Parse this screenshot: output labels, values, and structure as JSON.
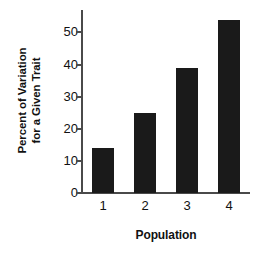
{
  "chart_data": {
    "type": "bar",
    "title": "",
    "categories": [
      "1",
      "2",
      "3",
      "4"
    ],
    "values": [
      14,
      25,
      39,
      54
    ],
    "series": [
      {
        "name": "Percent of Variation for a Given Trait",
        "values": [
          14,
          25,
          39,
          54
        ]
      }
    ],
    "xlabel": "Population",
    "ylabel": "Percent of Variation for a Given Trait",
    "ylabel_line1": "Percent of Variation",
    "ylabel_line2": "for a Given Trait",
    "ylim": [
      0,
      57
    ],
    "yticks": [
      0,
      10,
      20,
      30,
      40,
      50
    ],
    "ytick_labels": [
      "0",
      "10",
      "20",
      "30",
      "40",
      "50"
    ],
    "xtick_labels": [
      "1",
      "2",
      "3",
      "4"
    ],
    "grid": false,
    "legend": false,
    "legend_position": "none",
    "bar_color": "#1a1a1a",
    "axis_color": "#4a4a4a",
    "background_color": "#ffffff"
  }
}
